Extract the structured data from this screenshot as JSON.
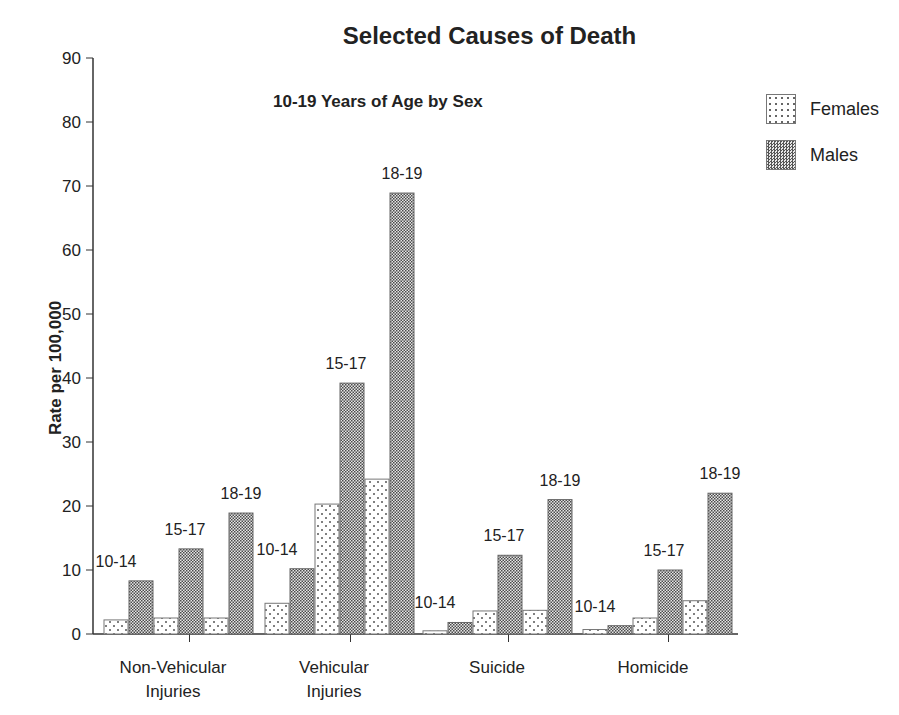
{
  "title": "Selected Causes of Death",
  "subtitle": "10-19 Years of Age by Sex",
  "legend": [
    {
      "label": "Females",
      "pattern": "dots",
      "color": "#ffffff"
    },
    {
      "label": "Males",
      "pattern": "checker",
      "color": "#555555"
    }
  ],
  "categories_display": [
    {
      "line1": "Non-Vehicular",
      "line2": "Injuries"
    },
    {
      "line1": "Vehicular",
      "line2": "Injuries"
    },
    {
      "line1": "Suicide",
      "line2": ""
    },
    {
      "line1": "Homicide",
      "line2": ""
    }
  ],
  "chart_data": {
    "type": "bar",
    "title": "Selected Causes of Death",
    "subtitle": "10-19 Years of Age by Sex",
    "xlabel": "",
    "ylabel": "Rate per 100,000",
    "ylim": [
      0,
      90
    ],
    "yticks": [
      0,
      10,
      20,
      30,
      40,
      50,
      60,
      70,
      80,
      90
    ],
    "grid": false,
    "legend_position": "top-right",
    "categories": [
      "Non-Vehicular Injuries",
      "Vehicular Injuries",
      "Suicide",
      "Homicide"
    ],
    "age_groups": [
      "10-14",
      "15-17",
      "18-19"
    ],
    "series": [
      {
        "name": "Females",
        "values": {
          "Non-Vehicular Injuries": [
            2.2,
            2.5,
            2.5
          ],
          "Vehicular Injuries": [
            4.8,
            20.3,
            24.2
          ],
          "Suicide": [
            0.5,
            3.6,
            3.7
          ],
          "Homicide": [
            0.7,
            2.5,
            5.2
          ]
        }
      },
      {
        "name": "Males",
        "values": {
          "Non-Vehicular Injuries": [
            8.3,
            13.3,
            18.9
          ],
          "Vehicular Injuries": [
            10.2,
            39.2,
            68.9
          ],
          "Suicide": [
            1.8,
            12.3,
            21.0
          ],
          "Homicide": [
            1.3,
            10.0,
            22.0
          ]
        }
      }
    ]
  }
}
